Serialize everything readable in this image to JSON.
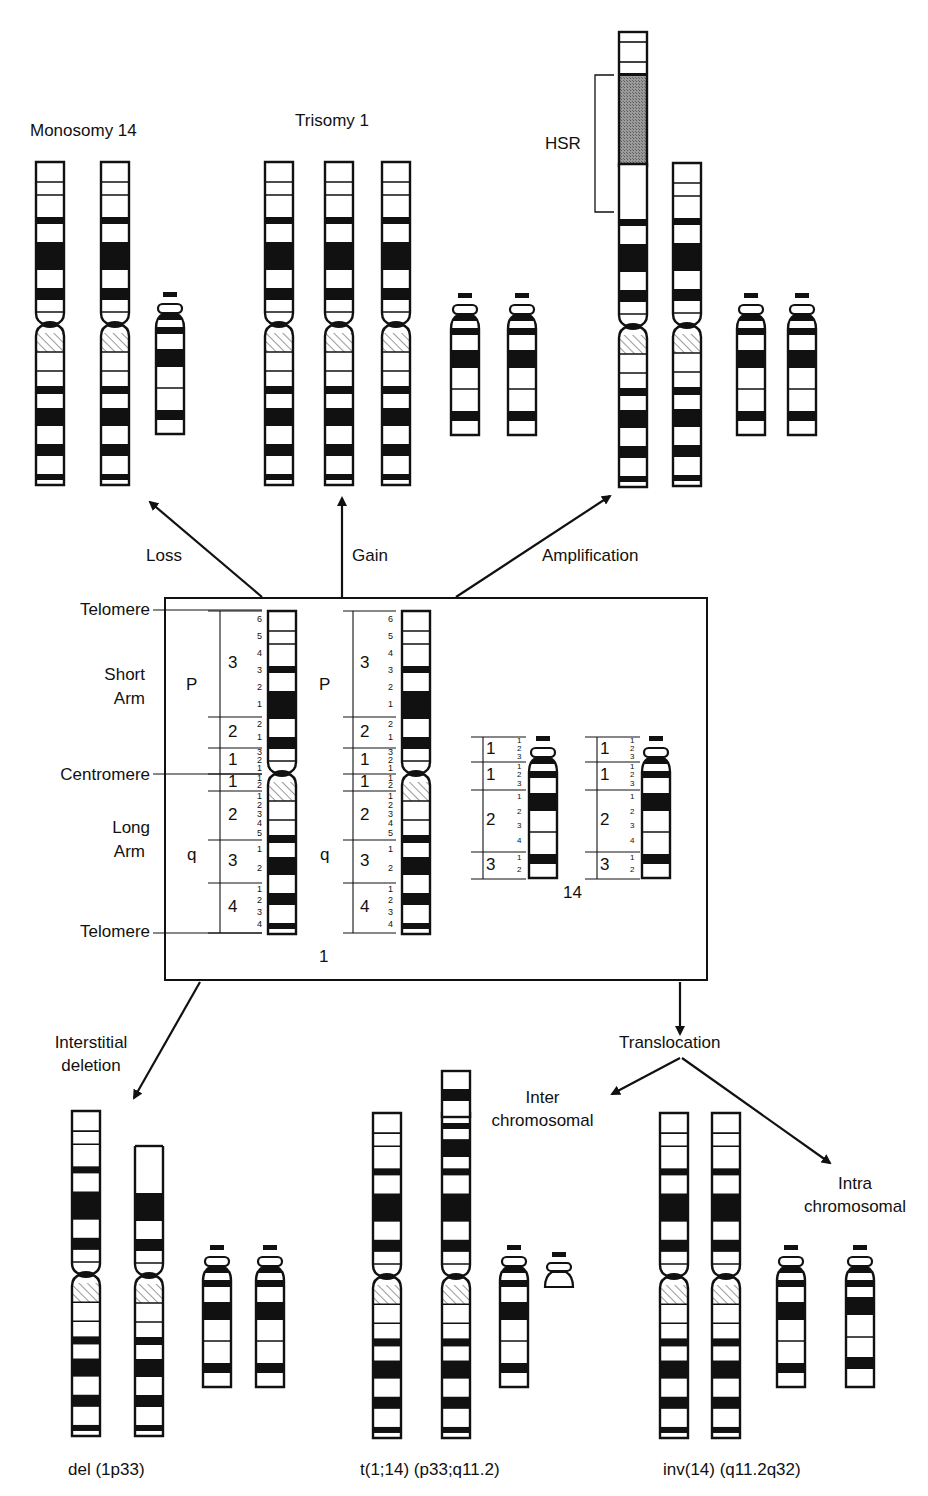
{
  "colors": {
    "ink": "#111111",
    "hsr_fill": "#8a8a8a",
    "background": "#ffffff"
  },
  "top_panels": {
    "monosomy": {
      "title": "Monosomy 14"
    },
    "trisomy": {
      "title": "Trisomy 1"
    },
    "amplification": {
      "hsr_label": "HSR"
    }
  },
  "arrows": {
    "loss": "Loss",
    "gain": "Gain",
    "amplification": "Amplification",
    "interstitial_deletion": [
      "Interstitial",
      "deletion"
    ],
    "translocation": "Translocation",
    "inter_chromosomal": [
      "Inter",
      "chromosomal"
    ],
    "intra_chromosomal": [
      "Intra",
      "chromosomal"
    ]
  },
  "ideogram_box": {
    "left_labels": {
      "telomere_top": "Telomere",
      "short_arm": [
        "Short",
        "Arm"
      ],
      "centromere": "Centromere",
      "long_arm": [
        "Long",
        "Arm"
      ],
      "telomere_bottom": "Telomere"
    },
    "chr1": {
      "number_label": "1",
      "arm_p": "P",
      "arm_q": "q",
      "regions": [
        {
          "region": "3",
          "bands": [
            "6",
            "5",
            "4",
            "3",
            "2",
            "1"
          ]
        },
        {
          "region": "2",
          "bands": [
            "2",
            "1"
          ]
        },
        {
          "region": "1",
          "bands": [
            "3",
            "2",
            "1"
          ]
        },
        {
          "region": "1",
          "bands": [
            "1",
            "2"
          ]
        },
        {
          "region": "2",
          "bands": [
            "1",
            "2",
            "3",
            "4",
            "5"
          ]
        },
        {
          "region": "3",
          "bands": [
            "1",
            "2"
          ]
        },
        {
          "region": "4",
          "bands": [
            "1",
            "2",
            "3",
            "4"
          ]
        }
      ]
    },
    "chr14": {
      "number_label": "14",
      "regions": [
        {
          "region": "1",
          "bands": [
            "1",
            "2",
            "3"
          ]
        },
        {
          "region": "1",
          "bands": [
            "1",
            "2",
            "3"
          ]
        },
        {
          "region": "2",
          "bands": [
            "1",
            "2",
            "3",
            "4"
          ]
        },
        {
          "region": "3",
          "bands": [
            "1",
            "2"
          ]
        }
      ]
    }
  },
  "bottom_captions": {
    "deletion": "del (1p33)",
    "translocation": "t(1;14) (p33;q11.2)",
    "inversion": "inv(14) (q11.2q32)"
  },
  "chromosome_layout": {
    "chr1_reference_height": 323,
    "chr14_reference_height": 140,
    "instances": [
      {
        "type": "chr1",
        "x": 36,
        "y": 162,
        "w": 28,
        "h": 323
      },
      {
        "type": "chr1",
        "x": 101,
        "y": 162,
        "w": 28,
        "h": 323
      },
      {
        "type": "chr14",
        "x": 156,
        "y": 292,
        "w": 28,
        "h": 142
      },
      {
        "type": "chr1",
        "x": 265,
        "y": 162,
        "w": 28,
        "h": 323
      },
      {
        "type": "chr1",
        "x": 325,
        "y": 162,
        "w": 28,
        "h": 323
      },
      {
        "type": "chr1",
        "x": 382,
        "y": 162,
        "w": 28,
        "h": 323
      },
      {
        "type": "chr14",
        "x": 451,
        "y": 293,
        "w": 28,
        "h": 142
      },
      {
        "type": "chr14",
        "x": 508,
        "y": 293,
        "w": 28,
        "h": 142
      },
      {
        "type": "chr1_hsr",
        "x": 619,
        "y": 32,
        "w": 28,
        "h": 455
      },
      {
        "type": "chr1",
        "x": 673,
        "y": 163,
        "w": 28,
        "h": 323
      },
      {
        "type": "chr14",
        "x": 737,
        "y": 293,
        "w": 28,
        "h": 142
      },
      {
        "type": "chr14",
        "x": 788,
        "y": 293,
        "w": 28,
        "h": 142
      },
      {
        "type": "chr1",
        "x": 268,
        "y": 611,
        "w": 28,
        "h": 323
      },
      {
        "type": "chr1",
        "x": 402,
        "y": 611,
        "w": 28,
        "h": 323
      },
      {
        "type": "chr14",
        "x": 529,
        "y": 736,
        "w": 28,
        "h": 142
      },
      {
        "type": "chr14",
        "x": 642,
        "y": 736,
        "w": 28,
        "h": 142
      },
      {
        "type": "chr1",
        "x": 72,
        "y": 1111,
        "w": 28,
        "h": 325
      },
      {
        "type": "chr1_del",
        "x": 135,
        "y": 1146,
        "w": 28,
        "h": 290
      },
      {
        "type": "chr14",
        "x": 203,
        "y": 1245,
        "w": 28,
        "h": 142
      },
      {
        "type": "chr14",
        "x": 256,
        "y": 1245,
        "w": 28,
        "h": 142
      },
      {
        "type": "chr1",
        "x": 373,
        "y": 1113,
        "w": 28,
        "h": 325
      },
      {
        "type": "chr1_trans",
        "x": 442,
        "y": 1071,
        "w": 28,
        "h": 367
      },
      {
        "type": "chr14",
        "x": 500,
        "y": 1245,
        "w": 28,
        "h": 142
      },
      {
        "type": "chr14_frag",
        "x": 545,
        "y": 1252,
        "w": 28,
        "h": 35
      },
      {
        "type": "chr1",
        "x": 660,
        "y": 1113,
        "w": 28,
        "h": 325
      },
      {
        "type": "chr1",
        "x": 712,
        "y": 1113,
        "w": 28,
        "h": 325
      },
      {
        "type": "chr14",
        "x": 777,
        "y": 1245,
        "w": 28,
        "h": 142
      },
      {
        "type": "chr14_inv",
        "x": 846,
        "y": 1245,
        "w": 28,
        "h": 142
      }
    ]
  }
}
